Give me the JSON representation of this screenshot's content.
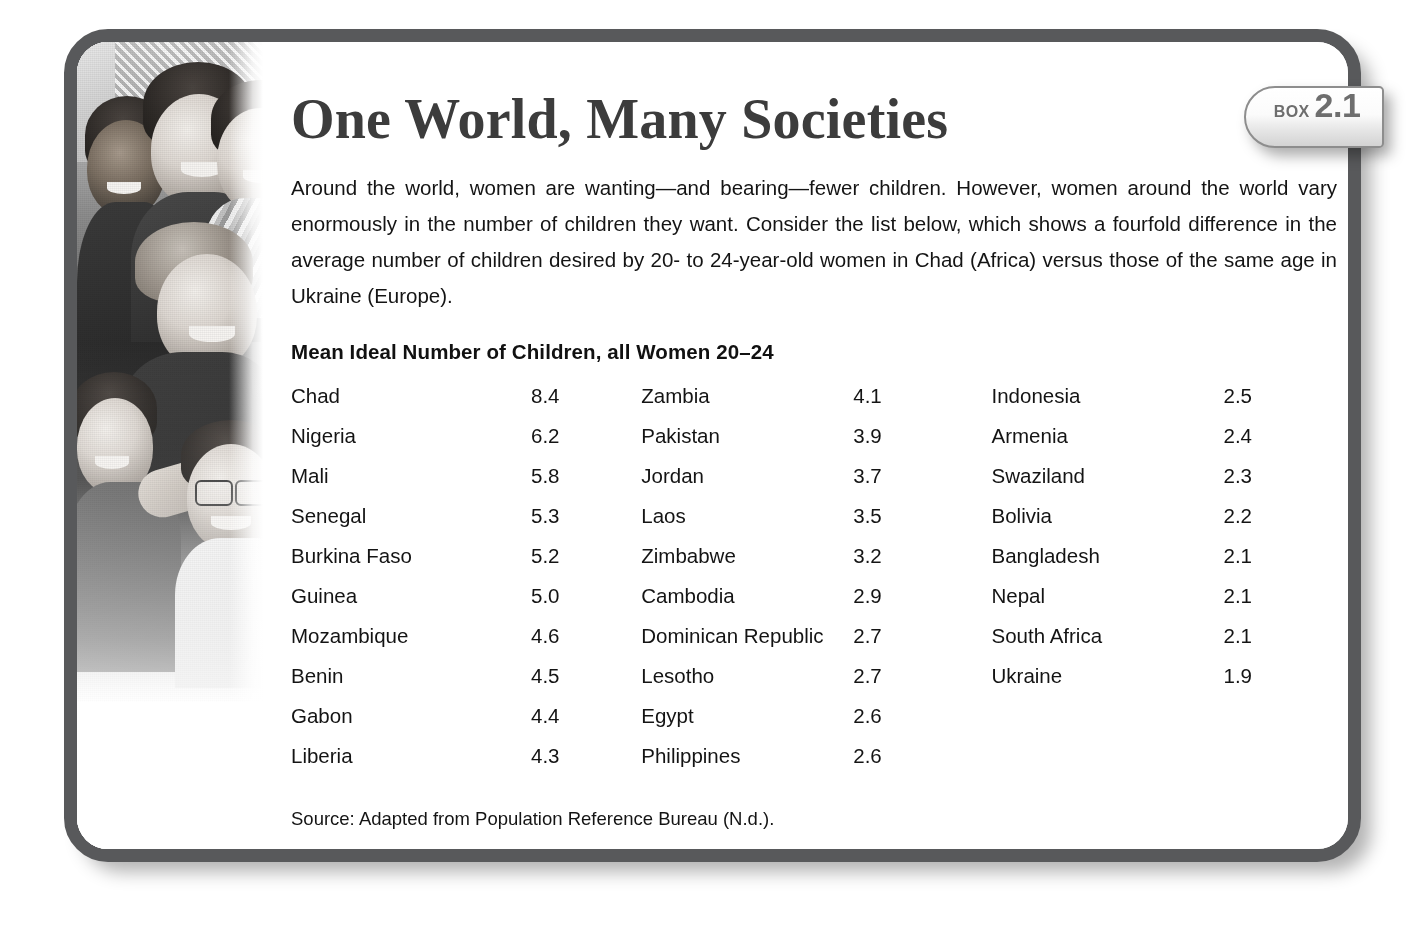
{
  "box": {
    "title": "One World, Many Societies",
    "tab_label": "BOX",
    "tab_number": "2.1",
    "intro": "Around the world, women are wanting—and bearing—fewer children. However, women around the world vary enormously in the number of children they want. Consider the list below, which shows a fourfold difference in the average number of children desired by 20- to 24-year-old women in Chad (Africa) versus those of the same age in Ukraine (Europe).",
    "list_heading": "Mean Ideal Number of Children, all Women 20–24",
    "source": "Source: Adapted from Population Reference Bureau (N.d.).",
    "photo_alt": "group-of-smiling-young-people-photo"
  },
  "colors": {
    "border": "#58595b",
    "title_text": "#3c3c3c",
    "body_text": "#141414",
    "tab_text": "#6e6e6e",
    "card_background": "#ffffff"
  },
  "chart_data": {
    "type": "table",
    "title": "Mean Ideal Number of Children, all Women 20–24",
    "columns": [
      "Country",
      "Mean ideal number of children"
    ],
    "units": "children",
    "source": "Adapted from Population Reference Bureau (N.d.).",
    "categories": [
      "Chad",
      "Nigeria",
      "Mali",
      "Senegal",
      "Burkina Faso",
      "Guinea",
      "Mozambique",
      "Benin",
      "Gabon",
      "Liberia",
      "Zambia",
      "Pakistan",
      "Jordan",
      "Laos",
      "Zimbabwe",
      "Cambodia",
      "Dominican Republic",
      "Lesotho",
      "Egypt",
      "Philippines",
      "Indonesia",
      "Armenia",
      "Swaziland",
      "Bolivia",
      "Bangladesh",
      "Nepal",
      "South Africa",
      "Ukraine"
    ],
    "values": [
      8.4,
      6.2,
      5.8,
      5.3,
      5.2,
      5.0,
      4.6,
      4.5,
      4.4,
      4.3,
      4.1,
      3.9,
      3.7,
      3.5,
      3.2,
      2.9,
      2.7,
      2.7,
      2.6,
      2.6,
      2.5,
      2.4,
      2.3,
      2.2,
      2.1,
      2.1,
      2.1,
      1.9
    ]
  },
  "columns": [
    {
      "rows": [
        {
          "country": "Chad",
          "value": "8.4"
        },
        {
          "country": "Nigeria",
          "value": "6.2"
        },
        {
          "country": "Mali",
          "value": "5.8"
        },
        {
          "country": "Senegal",
          "value": "5.3"
        },
        {
          "country": "Burkina Faso",
          "value": "5.2"
        },
        {
          "country": "Guinea",
          "value": "5.0"
        },
        {
          "country": "Mozambique",
          "value": "4.6"
        },
        {
          "country": "Benin",
          "value": "4.5"
        },
        {
          "country": "Gabon",
          "value": "4.4"
        },
        {
          "country": "Liberia",
          "value": "4.3"
        }
      ]
    },
    {
      "rows": [
        {
          "country": "Zambia",
          "value": "4.1"
        },
        {
          "country": "Pakistan",
          "value": "3.9"
        },
        {
          "country": "Jordan",
          "value": "3.7"
        },
        {
          "country": "Laos",
          "value": "3.5"
        },
        {
          "country": "Zimbabwe",
          "value": "3.2"
        },
        {
          "country": "Cambodia",
          "value": "2.9"
        },
        {
          "country": "Dominican Republic",
          "value": "2.7"
        },
        {
          "country": "Lesotho",
          "value": "2.7"
        },
        {
          "country": "Egypt",
          "value": "2.6"
        },
        {
          "country": "Philippines",
          "value": "2.6"
        }
      ]
    },
    {
      "rows": [
        {
          "country": "Indonesia",
          "value": "2.5"
        },
        {
          "country": "Armenia",
          "value": "2.4"
        },
        {
          "country": "Swaziland",
          "value": "2.3"
        },
        {
          "country": "Bolivia",
          "value": "2.2"
        },
        {
          "country": "Bangladesh",
          "value": "2.1"
        },
        {
          "country": "Nepal",
          "value": "2.1"
        },
        {
          "country": "South Africa",
          "value": "2.1"
        },
        {
          "country": "Ukraine",
          "value": "1.9"
        }
      ]
    }
  ]
}
